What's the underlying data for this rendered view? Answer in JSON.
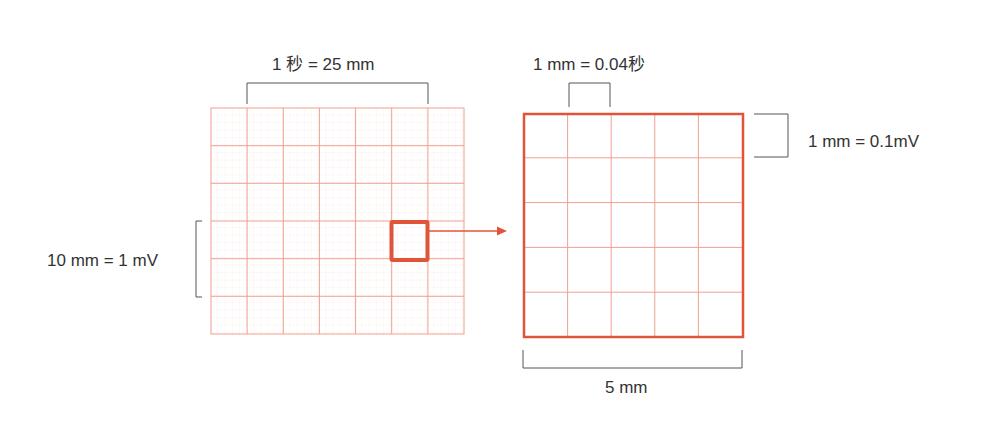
{
  "diagram": {
    "colors": {
      "grid_major": "#f0a090",
      "grid_minor": "#f8d4cc",
      "highlight": "#e0553a",
      "bracket": "#555555",
      "text": "#333333"
    },
    "large_grid": {
      "columns": 7,
      "rows": 6,
      "top_label": "1 秒 = 25 mm",
      "side_label": "10 mm = 1 mV"
    },
    "small_grid": {
      "columns": 5,
      "rows": 5,
      "top_label": "1 mm = 0.04秒",
      "side_label": "1  mm = 0.1mV",
      "bottom_label": "5 mm"
    }
  }
}
